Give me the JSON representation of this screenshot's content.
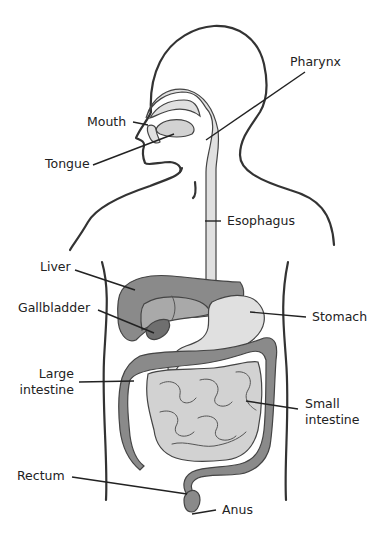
{
  "diagram": {
    "labels": {
      "pharynx": "Pharynx",
      "mouth": "Mouth",
      "tongue": "Tongue",
      "esophagus": "Esophagus",
      "liver": "Liver",
      "gallbladder": "Gallbladder",
      "stomach": "Stomach",
      "large_intestine_line1": "Large",
      "large_intestine_line2": "intestine",
      "small_intestine_line1": "Small",
      "small_intestine_line2": "intestine",
      "rectum": "Rectum",
      "anus": "Anus"
    },
    "colors": {
      "outline": "#333333",
      "pharynx_esophagus": "#e0e0e0",
      "liver": "#8a8a8a",
      "gallbladder": "#6f6f6f",
      "stomach": "#e4e4e4",
      "large_intestine": "#8a8a8a",
      "small_intestine": "#c8c8c8",
      "background": "#ffffff"
    }
  }
}
